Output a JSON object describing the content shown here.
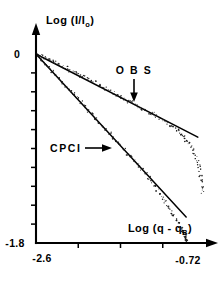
{
  "figure": {
    "background_color": "#ffffff",
    "ink_color": "#000000"
  },
  "chart_data": {
    "type": "scatter",
    "title": "",
    "xlabel": "Log (q - q",
    "xlabel_sub": "B",
    "xlabel_close": ")",
    "ylabel": "Log (I/I",
    "ylabel_sub": "o",
    "ylabel_close": ")",
    "xlim": [
      -2.6,
      -0.72
    ],
    "ylim": [
      -1.8,
      0.0
    ],
    "xticklabels": [
      "-2.6",
      "-0.72"
    ],
    "yticklabels": [
      "0",
      "-1.8"
    ],
    "grid": false,
    "legend_position": "inline-annotations",
    "x_tick_count": 3,
    "y_tick_count": 9,
    "annotations": [
      {
        "text": "O B S",
        "arrow": "down",
        "target_series": "OBS"
      },
      {
        "text": "CPCI",
        "arrow": "right",
        "target_series": "CPCI"
      }
    ],
    "series": [
      {
        "name": "OBS",
        "label": "O B S",
        "fit_slope_per_decade": -0.44,
        "fit_intercept_y": 0.0,
        "fit_x_range": [
          -2.6,
          -0.8
        ],
        "points_x": [
          -2.58,
          -2.54,
          -2.5,
          -2.46,
          -2.42,
          -2.38,
          -2.34,
          -2.3,
          -2.26,
          -2.22,
          -2.18,
          -2.14,
          -2.1,
          -2.06,
          -2.02,
          -1.98,
          -1.94,
          -1.9,
          -1.86,
          -1.82,
          -1.78,
          -1.74,
          -1.7,
          -1.66,
          -1.62,
          -1.58,
          -1.54,
          -1.5,
          -1.46,
          -1.42,
          -1.38,
          -1.34,
          -1.3,
          -1.26,
          -1.22,
          -1.18,
          -1.14,
          -1.1,
          -1.06,
          -1.02,
          -0.99,
          -0.96,
          -0.93,
          -0.9,
          -0.88,
          -0.86,
          -0.84,
          -0.82,
          -0.8,
          -0.79,
          -0.78,
          -0.77,
          -0.76,
          -0.755,
          -0.75
        ],
        "points_y": [
          -0.01,
          -0.02,
          -0.03,
          -0.05,
          -0.07,
          -0.08,
          -0.1,
          -0.12,
          -0.13,
          -0.16,
          -0.17,
          -0.18,
          -0.21,
          -0.22,
          -0.24,
          -0.26,
          -0.27,
          -0.3,
          -0.31,
          -0.33,
          -0.35,
          -0.37,
          -0.39,
          -0.41,
          -0.43,
          -0.45,
          -0.46,
          -0.48,
          -0.5,
          -0.52,
          -0.54,
          -0.56,
          -0.57,
          -0.59,
          -0.61,
          -0.63,
          -0.66,
          -0.68,
          -0.7,
          -0.73,
          -0.76,
          -0.79,
          -0.82,
          -0.85,
          -0.88,
          -0.91,
          -0.95,
          -0.99,
          -1.03,
          -1.07,
          -1.11,
          -1.16,
          -1.21,
          -1.26,
          -1.31
        ]
      },
      {
        "name": "CPCI",
        "label": "CPCI",
        "fit_slope_per_decade": -0.93,
        "fit_intercept_y": 0.0,
        "fit_x_range": [
          -2.6,
          -0.93
        ],
        "points_x": [
          -2.58,
          -2.54,
          -2.5,
          -2.46,
          -2.42,
          -2.38,
          -2.34,
          -2.3,
          -2.26,
          -2.22,
          -2.18,
          -2.14,
          -2.1,
          -2.06,
          -2.02,
          -1.98,
          -1.94,
          -1.9,
          -1.86,
          -1.82,
          -1.78,
          -1.74,
          -1.7,
          -1.66,
          -1.62,
          -1.58,
          -1.54,
          -1.5,
          -1.46,
          -1.42,
          -1.38,
          -1.34,
          -1.31,
          -1.28,
          -1.25,
          -1.22,
          -1.19,
          -1.16,
          -1.13,
          -1.1,
          -1.08,
          -1.06,
          -1.04,
          -1.02,
          -1.0,
          -0.985,
          -0.97,
          -0.96,
          -0.95,
          -0.945,
          -0.94,
          -0.935,
          -0.93,
          -0.925,
          -0.92
        ],
        "points_y": [
          -0.02,
          -0.05,
          -0.09,
          -0.13,
          -0.17,
          -0.2,
          -0.24,
          -0.28,
          -0.31,
          -0.35,
          -0.38,
          -0.42,
          -0.46,
          -0.5,
          -0.54,
          -0.57,
          -0.61,
          -0.65,
          -0.69,
          -0.72,
          -0.76,
          -0.8,
          -0.83,
          -0.87,
          -0.91,
          -0.95,
          -0.98,
          -1.02,
          -1.06,
          -1.1,
          -1.14,
          -1.18,
          -1.21,
          -1.25,
          -1.29,
          -1.33,
          -1.37,
          -1.41,
          -1.45,
          -1.49,
          -1.52,
          -1.55,
          -1.58,
          -1.61,
          -1.64,
          -1.66,
          -1.68,
          -1.7,
          -1.72,
          -1.735,
          -1.745,
          -1.755,
          -1.765,
          -1.772,
          -1.778
        ]
      }
    ]
  }
}
